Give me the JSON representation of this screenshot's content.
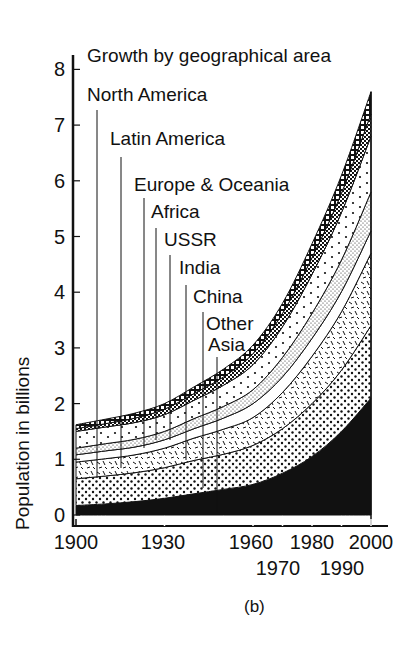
{
  "chart_data": {
    "type": "area",
    "stacked": true,
    "title": "Growth by geographical area",
    "xlabel": "",
    "ylabel": "Population in billions",
    "caption": "(b)",
    "ylim": [
      0,
      8
    ],
    "xlim": [
      1900,
      2000
    ],
    "yticks": [
      0,
      1,
      2,
      3,
      4,
      5,
      6,
      7,
      8
    ],
    "xticks": [
      1900,
      1930,
      1960,
      1970,
      1980,
      1990,
      2000
    ],
    "xtick_labels_row1": [
      "1900",
      "1930",
      "1960",
      "1980",
      "2000"
    ],
    "xtick_labels_row2": [
      "1970",
      "1990"
    ],
    "grid": false,
    "legend": "leader-line labels above chart",
    "x": [
      1900,
      1910,
      1920,
      1930,
      1940,
      1950,
      1960,
      1970,
      1980,
      1990,
      2000
    ],
    "series": [
      {
        "name": "Other Asia",
        "pattern": "solid-black",
        "values": [
          0.17,
          0.2,
          0.24,
          0.3,
          0.38,
          0.46,
          0.55,
          0.75,
          1.05,
          1.5,
          2.1
        ]
      },
      {
        "name": "China",
        "pattern": "dense-dots",
        "values": [
          0.48,
          0.5,
          0.52,
          0.55,
          0.6,
          0.63,
          0.7,
          0.8,
          0.95,
          1.1,
          1.3
        ]
      },
      {
        "name": "India",
        "pattern": "dashes",
        "values": [
          0.3,
          0.31,
          0.32,
          0.35,
          0.4,
          0.45,
          0.5,
          0.65,
          0.85,
          1.05,
          1.3
        ]
      },
      {
        "name": "USSR",
        "pattern": "white",
        "values": [
          0.13,
          0.14,
          0.14,
          0.15,
          0.17,
          0.2,
          0.25,
          0.28,
          0.32,
          0.36,
          0.4
        ]
      },
      {
        "name": "Africa",
        "pattern": "fine-stipple",
        "values": [
          0.12,
          0.13,
          0.14,
          0.15,
          0.18,
          0.21,
          0.25,
          0.35,
          0.45,
          0.57,
          0.7
        ]
      },
      {
        "name": "Europe & Oceania",
        "pattern": "sparse-dots",
        "values": [
          0.3,
          0.3,
          0.3,
          0.3,
          0.33,
          0.38,
          0.45,
          0.55,
          0.7,
          0.85,
          1.0
        ]
      },
      {
        "name": "Latin America",
        "pattern": "crosshatch",
        "values": [
          0.05,
          0.06,
          0.08,
          0.1,
          0.12,
          0.15,
          0.2,
          0.24,
          0.3,
          0.35,
          0.4
        ]
      },
      {
        "name": "North America",
        "pattern": "ladder",
        "values": [
          0.07,
          0.08,
          0.09,
          0.1,
          0.12,
          0.14,
          0.15,
          0.18,
          0.25,
          0.32,
          0.4
        ]
      }
    ],
    "cumulative_total": [
      1.62,
      1.72,
      1.83,
      2.0,
      2.3,
      2.62,
      3.05,
      3.8,
      4.87,
      6.1,
      7.6
    ]
  },
  "labels": {
    "title": "Growth by geographical area",
    "ylabel": "Population in billions",
    "caption": "(b)",
    "regions": [
      "North America",
      "Latin America",
      "Europe & Oceania",
      "Africa",
      "USSR",
      "India",
      "China",
      "Other",
      "Asia"
    ],
    "yticks": [
      "0",
      "1",
      "2",
      "3",
      "4",
      "5",
      "6",
      "7",
      "8"
    ]
  }
}
